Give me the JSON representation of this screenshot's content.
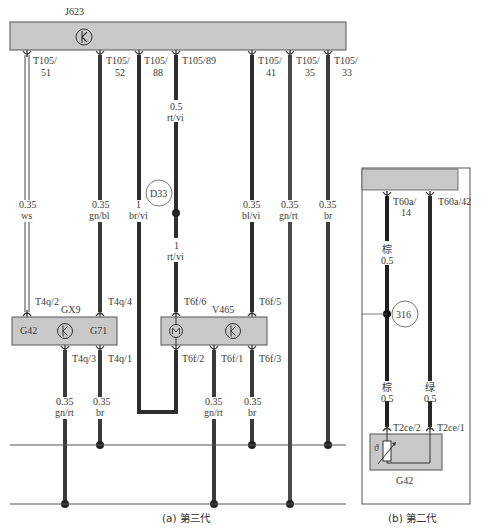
{
  "panel_a": {
    "caption": "(a) 第三代",
    "control_unit": {
      "id": "J623"
    },
    "pins_top": [
      {
        "pin": "T105/",
        "num": "51",
        "size": "0.35",
        "color": "ws"
      },
      {
        "pin": "T105/",
        "num": "52",
        "size": "0.35",
        "color": "gn/bl"
      },
      {
        "pin": "T105/",
        "num": "88",
        "size": "1",
        "color": "br/vi"
      },
      {
        "pin": "T105/89",
        "num": "",
        "size": "0.5",
        "color": "rt/vi"
      },
      {
        "pin": "T105/",
        "num": "41",
        "size": "0.35",
        "color": "bl/vi"
      },
      {
        "pin": "T105/",
        "num": "35",
        "size": "0.35",
        "color": "gn/rt"
      },
      {
        "pin": "T105/",
        "num": "33",
        "size": "0.35",
        "color": "br"
      }
    ],
    "splice": {
      "id": "D33",
      "size_after": "1",
      "color_after": "rt/vi"
    },
    "component_gx9": {
      "id": "GX9",
      "left_label": "G42",
      "right_label": "G71",
      "pin_in_left": "T4q/2",
      "pin_in_right": "T4q/4",
      "pin_out_left": "T4q/3",
      "pin_out_right": "T4q/1"
    },
    "component_v465": {
      "id": "V465",
      "pin_in_left": "T6f/6",
      "pin_in_right": "T6f/5",
      "pin_out_1": "T6f/2",
      "pin_out_2": "T6f/1",
      "pin_out_3": "T6f/3"
    },
    "lower_wires": [
      {
        "size": "0.35",
        "color": "gn/rt"
      },
      {
        "size": "0.35",
        "color": "br"
      },
      {
        "size": "0.35",
        "color": "gn/rt"
      },
      {
        "size": "0.35",
        "color": "br"
      }
    ]
  },
  "panel_b": {
    "caption": "(b) 第二代",
    "pins_top": [
      {
        "pin": "T60a/",
        "num": "14"
      },
      {
        "pin": "T60a/42",
        "num": ""
      }
    ],
    "wires": [
      {
        "color": "棕",
        "size": "0.5"
      },
      {
        "color": "绿",
        "size": "0.5"
      }
    ],
    "splice": {
      "id": "316"
    },
    "lower_wires": [
      {
        "color": "棕",
        "size": "0.5",
        "pin": "T2ce/2"
      },
      {
        "color": "绿",
        "size": "0.5",
        "pin": "T2ce/1"
      }
    ],
    "sensor": {
      "id": "G42",
      "symbol": "ϑ"
    }
  },
  "colors": {
    "module_fill": "#c8c8c8",
    "module_border": "#555555",
    "wire_dark": "#2e2e2e",
    "wire_mid": "#4a4a4a",
    "bus_line": "#555555"
  }
}
